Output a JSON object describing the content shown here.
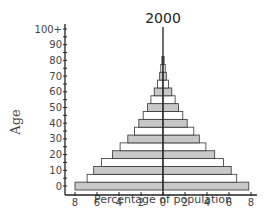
{
  "chart_data": {
    "type": "bar",
    "subtype": "population-pyramid",
    "title": "2000",
    "xlabel": "Percentage of population",
    "ylabel": "Age",
    "xlim": [
      -8,
      8
    ],
    "x_ticks": [
      8,
      6,
      4,
      2,
      0,
      2,
      4,
      6,
      8
    ],
    "y_ticks": [
      "0",
      "10",
      "20",
      "30",
      "40",
      "50",
      "60",
      "70",
      "80",
      "90",
      "100+"
    ],
    "grid": false,
    "legend": null,
    "categories": [
      "0-4",
      "5-9",
      "10-14",
      "15-19",
      "20-24",
      "25-29",
      "30-34",
      "35-39",
      "40-44",
      "45-49",
      "50-54",
      "55-59",
      "60-64",
      "65-69",
      "70-74",
      "75-79",
      "80+"
    ],
    "series": [
      {
        "name": "Left side",
        "values": [
          8.0,
          6.9,
          6.3,
          5.6,
          4.6,
          3.9,
          3.2,
          2.6,
          2.2,
          1.8,
          1.4,
          1.1,
          0.8,
          0.5,
          0.3,
          0.2,
          0.1
        ]
      },
      {
        "name": "Right side",
        "values": [
          7.8,
          6.7,
          6.2,
          5.5,
          4.7,
          3.9,
          3.3,
          2.8,
          2.2,
          1.8,
          1.4,
          1.1,
          0.8,
          0.5,
          0.3,
          0.2,
          0.1
        ]
      }
    ],
    "colors": {
      "shaded": "#c8c8c8",
      "unshaded": "#ffffff",
      "stroke": "#333333"
    }
  }
}
